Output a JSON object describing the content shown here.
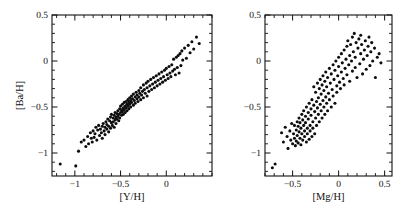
{
  "figure": {
    "background": "#ffffff",
    "point_color": "#0d0d0d",
    "axis_color": "#111111",
    "width": 406,
    "height": 215
  },
  "chart_data": [
    {
      "type": "scatter",
      "panel": "left",
      "title": "",
      "xlabel": "[Y/H]",
      "ylabel": "[Ba/H]",
      "xlim": [
        -1.25,
        0.5
      ],
      "ylim": [
        -1.25,
        0.5
      ],
      "xticks": [
        -1,
        -0.5,
        0
      ],
      "xticklabels": [
        "-1",
        "-0.5",
        "0"
      ],
      "yticks": [
        0.5,
        0,
        -0.5,
        -1
      ],
      "yticklabels": [
        "0.5",
        "0",
        "-0.5",
        "-1"
      ],
      "minor_tick_step": 0.1,
      "grid": false,
      "legend": "none",
      "marker": "filled-circle",
      "marker_size": 2.0,
      "n_points": 152,
      "x": [
        -1.16,
        -0.99,
        -0.96,
        -0.93,
        -0.9,
        -0.88,
        -0.86,
        -0.85,
        -0.83,
        -0.82,
        -0.81,
        -0.8,
        -0.79,
        -0.78,
        -0.77,
        -0.76,
        -0.75,
        -0.74,
        -0.73,
        -0.72,
        -0.71,
        -0.7,
        -0.7,
        -0.69,
        -0.68,
        -0.67,
        -0.67,
        -0.66,
        -0.65,
        -0.65,
        -0.64,
        -0.63,
        -0.63,
        -0.62,
        -0.61,
        -0.61,
        -0.6,
        -0.6,
        -0.59,
        -0.58,
        -0.58,
        -0.57,
        -0.57,
        -0.56,
        -0.56,
        -0.55,
        -0.55,
        -0.54,
        -0.54,
        -0.53,
        -0.53,
        -0.52,
        -0.52,
        -0.51,
        -0.51,
        -0.5,
        -0.5,
        -0.49,
        -0.49,
        -0.48,
        -0.48,
        -0.47,
        -0.47,
        -0.46,
        -0.46,
        -0.45,
        -0.45,
        -0.44,
        -0.44,
        -0.43,
        -0.43,
        -0.42,
        -0.42,
        -0.41,
        -0.41,
        -0.4,
        -0.4,
        -0.39,
        -0.39,
        -0.38,
        -0.38,
        -0.37,
        -0.36,
        -0.36,
        -0.35,
        -0.34,
        -0.34,
        -0.33,
        -0.32,
        -0.32,
        -0.31,
        -0.3,
        -0.3,
        -0.29,
        -0.28,
        -0.28,
        -0.27,
        -0.26,
        -0.25,
        -0.25,
        -0.24,
        -0.23,
        -0.22,
        -0.21,
        -0.21,
        -0.2,
        -0.19,
        -0.18,
        -0.17,
        -0.16,
        -0.15,
        -0.14,
        -0.13,
        -0.12,
        -0.11,
        -0.1,
        -0.09,
        -0.08,
        -0.07,
        -0.06,
        -0.05,
        -0.04,
        -0.03,
        -0.02,
        -0.01,
        0.0,
        0.01,
        0.02,
        0.03,
        0.04,
        0.05,
        0.06,
        0.07,
        0.08,
        0.09,
        0.1,
        0.11,
        0.12,
        0.13,
        0.14,
        0.15,
        0.16,
        0.17,
        0.18,
        0.2,
        0.22,
        0.24,
        0.26,
        0.28,
        0.3,
        0.33,
        0.36
      ],
      "y": [
        -1.12,
        -1.14,
        -0.98,
        -0.88,
        -0.86,
        -0.93,
        -0.82,
        -0.9,
        -0.78,
        -0.84,
        -0.88,
        -0.76,
        -0.83,
        -0.79,
        -0.72,
        -0.86,
        -0.75,
        -0.7,
        -0.81,
        -0.74,
        -0.78,
        -0.71,
        -0.84,
        -0.68,
        -0.76,
        -0.72,
        -0.8,
        -0.66,
        -0.74,
        -0.69,
        -0.63,
        -0.71,
        -0.77,
        -0.65,
        -0.61,
        -0.73,
        -0.67,
        -0.58,
        -0.7,
        -0.62,
        -0.66,
        -0.59,
        -0.72,
        -0.64,
        -0.56,
        -0.61,
        -0.68,
        -0.57,
        -0.63,
        -0.54,
        -0.6,
        -0.58,
        -0.65,
        -0.52,
        -0.62,
        -0.56,
        -0.49,
        -0.59,
        -0.53,
        -0.47,
        -0.55,
        -0.51,
        -0.58,
        -0.45,
        -0.53,
        -0.49,
        -0.56,
        -0.44,
        -0.51,
        -0.47,
        -0.54,
        -0.42,
        -0.49,
        -0.45,
        -0.52,
        -0.4,
        -0.47,
        -0.43,
        -0.5,
        -0.38,
        -0.45,
        -0.41,
        -0.48,
        -0.36,
        -0.43,
        -0.39,
        -0.46,
        -0.34,
        -0.41,
        -0.37,
        -0.44,
        -0.32,
        -0.39,
        -0.35,
        -0.42,
        -0.29,
        -0.37,
        -0.33,
        -0.26,
        -0.4,
        -0.31,
        -0.35,
        -0.24,
        -0.29,
        -0.38,
        -0.22,
        -0.33,
        -0.27,
        -0.2,
        -0.31,
        -0.25,
        -0.18,
        -0.29,
        -0.23,
        -0.16,
        -0.27,
        -0.21,
        -0.14,
        -0.25,
        -0.19,
        -0.12,
        -0.23,
        -0.17,
        -0.1,
        -0.21,
        -0.08,
        -0.15,
        -0.19,
        -0.06,
        -0.13,
        -0.17,
        -0.04,
        -0.11,
        0.02,
        -0.09,
        -0.15,
        0.04,
        -0.07,
        0.06,
        -0.13,
        0.08,
        -0.05,
        0.11,
        0.01,
        0.14,
        0.03,
        0.17,
        0.09,
        0.21,
        0.13,
        0.26,
        0.19
      ]
    },
    {
      "type": "scatter",
      "panel": "right",
      "title": "",
      "xlabel": "[Mg/H]",
      "ylabel": "[Ba/H]",
      "xlim": [
        -0.8,
        0.58
      ],
      "ylim": [
        -1.25,
        0.5
      ],
      "xticks": [
        -0.5,
        0,
        0.5
      ],
      "xticklabels": [
        "-0.5",
        "0",
        "0.5"
      ],
      "yticks": [
        0.5,
        0,
        -0.5,
        -1
      ],
      "yticklabels": [
        "0.5",
        "0",
        "-0.5",
        "-1"
      ],
      "minor_tick_step": 0.1,
      "grid": false,
      "legend": "none",
      "marker": "filled-circle",
      "marker_size": 2.0,
      "n_points": 152,
      "x": [
        -0.72,
        -0.69,
        -0.62,
        -0.6,
        -0.58,
        -0.56,
        -0.55,
        -0.53,
        -0.52,
        -0.51,
        -0.5,
        -0.49,
        -0.48,
        -0.48,
        -0.47,
        -0.46,
        -0.46,
        -0.45,
        -0.45,
        -0.44,
        -0.44,
        -0.43,
        -0.43,
        -0.42,
        -0.42,
        -0.41,
        -0.41,
        -0.4,
        -0.4,
        -0.39,
        -0.39,
        -0.38,
        -0.38,
        -0.37,
        -0.37,
        -0.36,
        -0.36,
        -0.35,
        -0.35,
        -0.34,
        -0.34,
        -0.33,
        -0.33,
        -0.32,
        -0.32,
        -0.31,
        -0.31,
        -0.3,
        -0.3,
        -0.29,
        -0.29,
        -0.28,
        -0.28,
        -0.27,
        -0.27,
        -0.26,
        -0.26,
        -0.25,
        -0.25,
        -0.24,
        -0.24,
        -0.23,
        -0.23,
        -0.22,
        -0.22,
        -0.21,
        -0.21,
        -0.2,
        -0.2,
        -0.19,
        -0.19,
        -0.18,
        -0.18,
        -0.17,
        -0.17,
        -0.16,
        -0.16,
        -0.15,
        -0.15,
        -0.14,
        -0.14,
        -0.13,
        -0.13,
        -0.12,
        -0.12,
        -0.11,
        -0.1,
        -0.1,
        -0.09,
        -0.08,
        -0.08,
        -0.07,
        -0.06,
        -0.06,
        -0.05,
        -0.04,
        -0.04,
        -0.03,
        -0.02,
        -0.02,
        -0.01,
        0.0,
        0.0,
        0.01,
        0.02,
        0.03,
        0.03,
        0.04,
        0.05,
        0.06,
        0.06,
        0.07,
        0.08,
        0.09,
        0.09,
        0.1,
        0.11,
        0.12,
        0.12,
        0.13,
        0.14,
        0.15,
        0.15,
        0.16,
        0.17,
        0.18,
        0.18,
        0.19,
        0.2,
        0.21,
        0.22,
        0.23,
        0.24,
        0.24,
        0.25,
        0.26,
        0.27,
        0.28,
        0.29,
        0.3,
        0.31,
        0.32,
        0.33,
        0.34,
        0.35,
        0.36,
        0.37,
        0.39,
        0.4,
        0.42,
        0.44,
        0.46
      ],
      "y": [
        -1.16,
        -1.12,
        -0.78,
        -0.88,
        -0.72,
        -0.82,
        -0.95,
        -0.76,
        -0.86,
        -0.68,
        -0.9,
        -0.79,
        -0.84,
        -0.7,
        -0.92,
        -0.75,
        -0.87,
        -0.66,
        -0.81,
        -0.71,
        -0.89,
        -0.62,
        -0.77,
        -0.84,
        -0.67,
        -0.73,
        -0.91,
        -0.58,
        -0.79,
        -0.64,
        -0.86,
        -0.7,
        -0.54,
        -0.76,
        -0.82,
        -0.6,
        -0.67,
        -0.88,
        -0.5,
        -0.73,
        -0.79,
        -0.56,
        -0.63,
        -0.85,
        -0.46,
        -0.7,
        -0.76,
        -0.52,
        -0.59,
        -0.82,
        -0.42,
        -0.66,
        -0.73,
        -0.48,
        -0.28,
        -0.55,
        -0.79,
        -0.62,
        -0.34,
        -0.44,
        -0.7,
        -0.51,
        -0.24,
        -0.58,
        -0.4,
        -0.66,
        -0.3,
        -0.47,
        -0.2,
        -0.54,
        -0.36,
        -0.62,
        -0.26,
        -0.43,
        -0.16,
        -0.5,
        -0.32,
        -0.58,
        -0.22,
        -0.39,
        -0.12,
        -0.46,
        -0.28,
        -0.54,
        -0.18,
        -0.35,
        -0.08,
        -0.42,
        -0.24,
        -0.5,
        -0.14,
        -0.31,
        -0.04,
        -0.38,
        -0.2,
        -0.46,
        -0.1,
        0.0,
        -0.27,
        -0.34,
        -0.16,
        -0.06,
        0.04,
        -0.23,
        -0.3,
        -0.12,
        0.08,
        -0.02,
        -0.19,
        0.12,
        -0.26,
        -0.08,
        0.02,
        0.16,
        -0.15,
        0.22,
        -0.04,
        0.06,
        -0.22,
        0.18,
        0.0,
        0.26,
        -0.11,
        0.1,
        0.3,
        -0.07,
        0.04,
        0.2,
        -0.18,
        0.14,
        0.24,
        -0.03,
        0.08,
        0.28,
        0.18,
        -0.14,
        0.02,
        0.12,
        0.22,
        -0.09,
        0.06,
        0.16,
        0.26,
        -0.05,
        0.1,
        0.2,
        0.0,
        0.14,
        -0.18,
        0.04,
        0.08,
        -0.02
      ]
    }
  ]
}
